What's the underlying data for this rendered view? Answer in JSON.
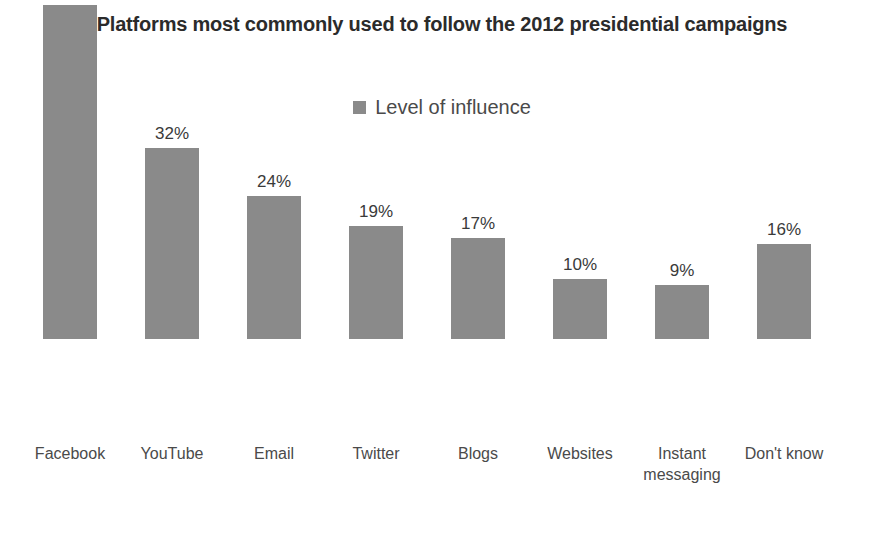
{
  "chart": {
    "title": "Platforms most commonly used to follow the 2012 presidential campaigns",
    "legend_label": "Level of influence",
    "legend_swatch_color": "#8a8a8a",
    "bar_color": "#8a8a8a",
    "background_color": "#ffffff",
    "title_color": "#2b2b2b",
    "label_color": "#4a4a4a"
  },
  "chart_data": {
    "type": "bar",
    "title": "Platforms most commonly used to follow the 2012 presidential campaigns",
    "xlabel": "",
    "ylabel": "",
    "ylim": [
      0,
      60
    ],
    "grid": false,
    "legend_position": "top-center",
    "series": [
      {
        "name": "Level of influence",
        "values": [
          56,
          32,
          24,
          19,
          17,
          10,
          9,
          16
        ],
        "value_labels": [
          "56%",
          "32%",
          "24%",
          "19%",
          "17%",
          "10%",
          "9%",
          "16%"
        ],
        "color": "#8a8a8a"
      }
    ],
    "categories": [
      "Facebook",
      "YouTube",
      "Email",
      "Twitter",
      "Blogs",
      "Websites",
      "Instant\nmessaging",
      "Don't know"
    ]
  }
}
